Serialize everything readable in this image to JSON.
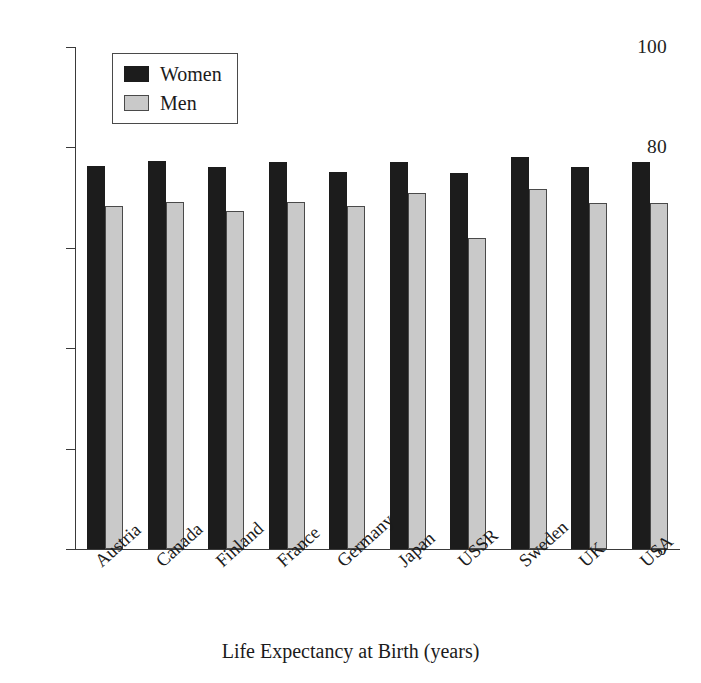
{
  "chart_data": {
    "type": "bar",
    "title": "",
    "xlabel": "Life Expectancy at Birth (years)",
    "ylabel": "",
    "ylim": [
      0,
      100
    ],
    "yticks": [
      0,
      20,
      40,
      60,
      80,
      100
    ],
    "grid": false,
    "legend_position": "top-left",
    "categories": [
      "Austria",
      "Canada",
      "Finland",
      "France",
      "Germany",
      "Japan",
      "USSR",
      "Sweden",
      "UK",
      "USA"
    ],
    "series": [
      {
        "name": "Women",
        "color": "#1c1c1c",
        "values": [
          76.2,
          77.2,
          76.1,
          77.0,
          75.2,
          77.0,
          75.0,
          78.0,
          76.0,
          77.0
        ]
      },
      {
        "name": "Men",
        "color": "#c9c9c9",
        "values": [
          68.4,
          69.2,
          67.3,
          69.1,
          68.3,
          70.9,
          62.0,
          71.7,
          69.0,
          69.0
        ]
      }
    ]
  },
  "legend": {
    "items": [
      {
        "label": "Women",
        "swatch": "women-swatch"
      },
      {
        "label": "Men",
        "swatch": "men-swatch"
      }
    ]
  },
  "axes": {
    "x_title": "Life Expectancy at Birth (years)",
    "y_tick_labels": [
      "0",
      "20",
      "40",
      "60",
      "80",
      "100"
    ]
  }
}
